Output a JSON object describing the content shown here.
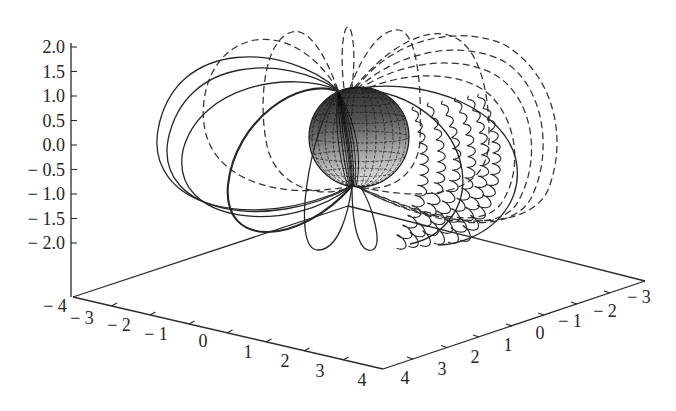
{
  "chart_data": {
    "type": "line",
    "projection": "3d",
    "title": "",
    "xlabel": "",
    "ylabel": "",
    "zlabel": "",
    "grid": false,
    "legend": null,
    "axes": {
      "z": {
        "range": [
          -2.0,
          2.0
        ],
        "ticks": [
          2.0,
          1.5,
          1.0,
          0.5,
          0.0,
          -0.5,
          -1.0,
          -1.5,
          -2.0
        ],
        "tick_labels": [
          "2.0",
          "1.5",
          "1.0",
          "0.5",
          "0.0",
          "− 0.5",
          "− 1.0",
          "− 1.5",
          "− 2.0"
        ]
      },
      "x": {
        "range": [
          -4,
          4
        ],
        "ticks": [
          -4,
          -3,
          -2,
          -1,
          0,
          1,
          2,
          3,
          4
        ],
        "tick_labels": [
          "− 4",
          "− 3",
          "− 2",
          "− 1",
          "0",
          "1",
          "2",
          "3",
          "4"
        ]
      },
      "y": {
        "range": [
          -4,
          4
        ],
        "ticks": [
          4,
          3,
          2,
          1,
          0,
          -1,
          -2,
          -3
        ],
        "tick_labels": [
          "4",
          "3",
          "2",
          "1",
          "0",
          "− 1",
          "− 2",
          "− 3"
        ]
      }
    },
    "series": [
      {
        "name": "sphere",
        "type": "surface",
        "center": [
          0,
          0,
          0
        ],
        "radius": 1,
        "style": "shaded wireframe"
      },
      {
        "name": "solid closed curves",
        "style": "solid",
        "count": 8,
        "side": "front/left"
      },
      {
        "name": "dashed closed curves",
        "style": "dashed",
        "count": 9,
        "side": "back/top/right"
      },
      {
        "name": "wavy (helical) curves",
        "style": "solid wavy",
        "count": 6,
        "side": "right"
      }
    ]
  }
}
